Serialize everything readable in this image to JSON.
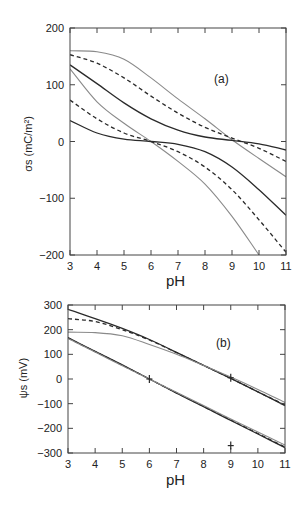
{
  "chart_data": [
    {
      "type": "line",
      "panel": "(a)",
      "xlabel": "pH",
      "ylabel": "σs (mC/m²)",
      "xlim": [
        3,
        11
      ],
      "ylim": [
        -200,
        200
      ],
      "xticks": [
        3,
        4,
        5,
        6,
        7,
        8,
        9,
        10,
        11
      ],
      "yticks": [
        -200,
        -100,
        0,
        100,
        200
      ],
      "grid": false,
      "legend": null,
      "annotations": [
        "(a)"
      ],
      "x": [
        3,
        4,
        5,
        6,
        7,
        8,
        9,
        10,
        11
      ],
      "series": [
        {
          "name": "upper gray solid",
          "style": "gray-solid",
          "values": [
            160,
            158,
            145,
            112,
            75,
            40,
            3,
            -30,
            -62
          ]
        },
        {
          "name": "upper dashed",
          "style": "black-dashed",
          "values": [
            153,
            138,
            112,
            80,
            50,
            25,
            6,
            -12,
            -35
          ]
        },
        {
          "name": "upper black solid",
          "style": "black-solid",
          "values": [
            135,
            102,
            68,
            40,
            20,
            8,
            2,
            -4,
            -15
          ]
        },
        {
          "name": "lower gray solid",
          "style": "gray-solid",
          "values": [
            128,
            70,
            32,
            0,
            -35,
            -75,
            -132,
            -200,
            null
          ]
        },
        {
          "name": "lower dashed",
          "style": "black-dashed",
          "values": [
            73,
            40,
            15,
            0,
            -18,
            -45,
            -85,
            -138,
            -195
          ]
        },
        {
          "name": "lower black solid",
          "style": "black-solid",
          "values": [
            37,
            15,
            4,
            0,
            -5,
            -18,
            -45,
            -85,
            -130
          ]
        }
      ]
    },
    {
      "type": "line",
      "panel": "(b)",
      "xlabel": "pH",
      "ylabel": "ψs (mV)",
      "xlim": [
        3,
        11
      ],
      "ylim": [
        -300,
        300
      ],
      "xticks": [
        3,
        4,
        5,
        6,
        7,
        8,
        9,
        10,
        11
      ],
      "yticks": [
        -300,
        -200,
        -100,
        0,
        100,
        200,
        300
      ],
      "grid": false,
      "legend": null,
      "annotations": [
        "(b)",
        "+ marker at pH 6, 0 mV",
        "+ marker at pH 9, 0 mV",
        "+ marker at pH 9, -270 mV"
      ],
      "x": [
        3,
        4,
        5,
        6,
        7,
        8,
        9,
        10,
        11
      ],
      "series": [
        {
          "name": "upper black solid",
          "style": "black-solid",
          "values": [
            282,
            245,
            205,
            160,
            108,
            55,
            3,
            -52,
            -108
          ]
        },
        {
          "name": "upper dashed",
          "style": "black-dashed",
          "values": [
            245,
            233,
            200,
            158,
            107,
            55,
            3,
            -52,
            -105
          ]
        },
        {
          "name": "upper gray solid",
          "style": "gray-solid",
          "values": [
            190,
            188,
            175,
            140,
            100,
            55,
            8,
            -42,
            -95
          ]
        },
        {
          "name": "lower black solid",
          "style": "black-solid",
          "values": [
            168,
            112,
            57,
            0,
            -57,
            -112,
            -168,
            -223,
            -278
          ]
        },
        {
          "name": "lower dashed",
          "style": "black-dashed",
          "values": [
            166,
            111,
            56,
            0,
            -56,
            -111,
            -166,
            -221,
            -276
          ]
        },
        {
          "name": "lower gray solid",
          "style": "gray-solid",
          "values": [
            164,
            109,
            54,
            0,
            -54,
            -108,
            -162,
            -215,
            -268
          ]
        }
      ]
    }
  ],
  "labels": {
    "panel_a": "(a)",
    "panel_b": "(b)",
    "xlabel_a": "pH",
    "xlabel_b": "pH",
    "ylabel_a": "σs (mC/m²)",
    "ylabel_b": "ψs (mV)"
  },
  "colors": {
    "black": "#2a2a2a",
    "gray": "#8a8a8a",
    "axis": "#444444"
  }
}
